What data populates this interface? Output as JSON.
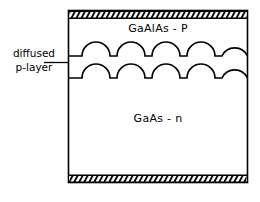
{
  "figure": {
    "colors": {
      "ink": "#000000",
      "background": "#ffffff",
      "hatch": "#000000"
    },
    "regions": [
      {
        "id": "upper-layer",
        "label": "GaAlAs - P",
        "material": "GaAlAs",
        "doping": "P"
      },
      {
        "id": "lower-layer",
        "label": "GaAs - n",
        "material": "GaAs",
        "doping": "n"
      }
    ],
    "annotation": {
      "line1": "diffused",
      "line2": "p-layer"
    },
    "contacts": {
      "top": {
        "style": "hatched-band",
        "lines": 36
      },
      "bottom": {
        "style": "hatched-band",
        "lines": 36
      }
    },
    "interfaces": {
      "count": 2,
      "style": "scalloped",
      "bumps_per_line": 5
    },
    "geometry": {
      "box_left": 68,
      "box_right": 248,
      "box_top": 10,
      "box_bottom": 183,
      "hatch_band_height": 7,
      "scallop_line_upper_y": 56,
      "scallop_line_lower_y": 78,
      "bump_radius": 14,
      "leader_tick_x": 56,
      "leader_tick_y": 62
    }
  }
}
